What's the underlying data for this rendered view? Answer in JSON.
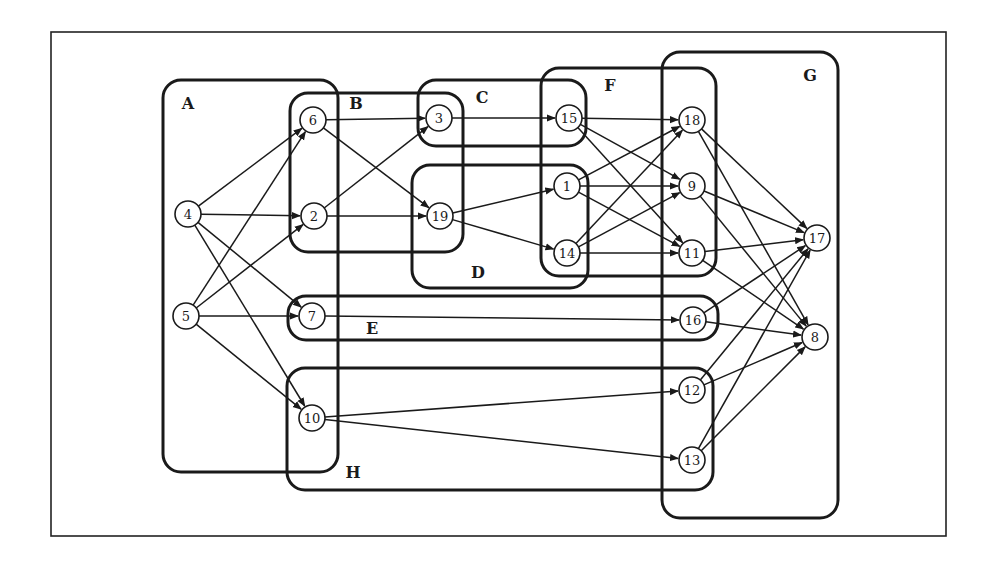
{
  "diagram": {
    "type": "directed-graph-with-groups",
    "frame": {
      "x": 51,
      "y": 32,
      "w": 895,
      "h": 504
    },
    "colors": {
      "stroke": "#1a1a1a",
      "background": "#ffffff"
    },
    "groups": [
      {
        "id": "A",
        "label": "A",
        "x": 163,
        "y": 80,
        "w": 175,
        "h": 392,
        "label_x": 188,
        "label_y": 103
      },
      {
        "id": "B",
        "label": "B",
        "x": 290,
        "y": 93,
        "w": 173,
        "h": 159,
        "label_x": 356,
        "label_y": 103
      },
      {
        "id": "C",
        "label": "C",
        "x": 418,
        "y": 80,
        "w": 168,
        "h": 66,
        "label_x": 482,
        "label_y": 97
      },
      {
        "id": "D",
        "label": "D",
        "x": 412,
        "y": 165,
        "w": 176,
        "h": 123,
        "label_x": 478,
        "label_y": 272
      },
      {
        "id": "F",
        "label": "F",
        "x": 541,
        "y": 68,
        "w": 175,
        "h": 208,
        "label_x": 610,
        "label_y": 85
      },
      {
        "id": "G",
        "label": "G",
        "x": 662,
        "y": 52,
        "w": 176,
        "h": 466,
        "label_x": 810,
        "label_y": 75
      },
      {
        "id": "E",
        "label": "E",
        "x": 288,
        "y": 296,
        "w": 430,
        "h": 44,
        "label_x": 372,
        "label_y": 328
      },
      {
        "id": "H",
        "label": "H",
        "x": 287,
        "y": 368,
        "w": 426,
        "h": 122,
        "label_x": 353,
        "label_y": 472
      }
    ],
    "nodes": [
      {
        "id": "4",
        "label": "4",
        "x": 188,
        "y": 214
      },
      {
        "id": "5",
        "label": "5",
        "x": 186,
        "y": 316
      },
      {
        "id": "6",
        "label": "6",
        "x": 313,
        "y": 120
      },
      {
        "id": "2",
        "label": "2",
        "x": 314,
        "y": 216
      },
      {
        "id": "7",
        "label": "7",
        "x": 312,
        "y": 316
      },
      {
        "id": "10",
        "label": "10",
        "x": 312,
        "y": 418
      },
      {
        "id": "3",
        "label": "3",
        "x": 439,
        "y": 118
      },
      {
        "id": "19",
        "label": "19",
        "x": 440,
        "y": 216
      },
      {
        "id": "15",
        "label": "15",
        "x": 569,
        "y": 118
      },
      {
        "id": "1",
        "label": "1",
        "x": 567,
        "y": 186
      },
      {
        "id": "14",
        "label": "14",
        "x": 567,
        "y": 253
      },
      {
        "id": "18",
        "label": "18",
        "x": 692,
        "y": 120
      },
      {
        "id": "9",
        "label": "9",
        "x": 692,
        "y": 186
      },
      {
        "id": "11",
        "label": "11",
        "x": 692,
        "y": 253
      },
      {
        "id": "16",
        "label": "16",
        "x": 693,
        "y": 320
      },
      {
        "id": "12",
        "label": "12",
        "x": 692,
        "y": 390
      },
      {
        "id": "13",
        "label": "13",
        "x": 692,
        "y": 460
      },
      {
        "id": "17",
        "label": "17",
        "x": 817,
        "y": 238
      },
      {
        "id": "8",
        "label": "8",
        "x": 815,
        "y": 337
      }
    ],
    "edges": [
      [
        "4",
        "6"
      ],
      [
        "4",
        "2"
      ],
      [
        "4",
        "7"
      ],
      [
        "4",
        "10"
      ],
      [
        "5",
        "6"
      ],
      [
        "5",
        "2"
      ],
      [
        "5",
        "7"
      ],
      [
        "5",
        "10"
      ],
      [
        "6",
        "3"
      ],
      [
        "6",
        "19"
      ],
      [
        "2",
        "3"
      ],
      [
        "2",
        "19"
      ],
      [
        "3",
        "15"
      ],
      [
        "19",
        "1"
      ],
      [
        "19",
        "14"
      ],
      [
        "15",
        "18"
      ],
      [
        "15",
        "9"
      ],
      [
        "15",
        "11"
      ],
      [
        "1",
        "18"
      ],
      [
        "1",
        "9"
      ],
      [
        "1",
        "11"
      ],
      [
        "14",
        "18"
      ],
      [
        "14",
        "9"
      ],
      [
        "14",
        "11"
      ],
      [
        "7",
        "16"
      ],
      [
        "10",
        "12"
      ],
      [
        "10",
        "13"
      ],
      [
        "18",
        "17"
      ],
      [
        "18",
        "8"
      ],
      [
        "9",
        "17"
      ],
      [
        "9",
        "8"
      ],
      [
        "11",
        "17"
      ],
      [
        "11",
        "8"
      ],
      [
        "16",
        "17"
      ],
      [
        "16",
        "8"
      ],
      [
        "12",
        "17"
      ],
      [
        "12",
        "8"
      ],
      [
        "13",
        "17"
      ],
      [
        "13",
        "8"
      ]
    ],
    "node_radius": 13
  }
}
